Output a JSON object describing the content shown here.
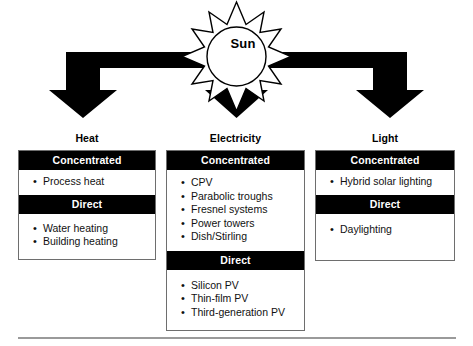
{
  "diagram": {
    "source": {
      "label": "Sun",
      "icon": "sun-icon"
    },
    "columns": [
      {
        "title": "Heat",
        "sections": [
          {
            "header": "Concentrated",
            "items": [
              "Process heat"
            ]
          },
          {
            "header": "Direct",
            "items": [
              "Water heating",
              "Building heating"
            ]
          }
        ]
      },
      {
        "title": "Electricity",
        "sections": [
          {
            "header": "Concentrated",
            "items": [
              "CPV",
              "Parabolic troughs",
              "Fresnel systems",
              "Power towers",
              "Dish/Stirling"
            ]
          },
          {
            "header": "Direct",
            "items": [
              "Silicon PV",
              "Thin-film PV",
              "Third-generation PV"
            ]
          }
        ]
      },
      {
        "title": "Light",
        "sections": [
          {
            "header": "Concentrated",
            "items": [
              "Hybrid solar lighting"
            ]
          },
          {
            "header": "Direct",
            "items": [
              "Daylighting"
            ]
          }
        ]
      }
    ],
    "bullet_glyph": "•",
    "colors": {
      "band_background": "#000000",
      "band_text": "#ffffff",
      "panel_border": "#6e6e6e",
      "arrow": "#000000",
      "page_background": "#ffffff",
      "rule": "#9a9a9a"
    }
  }
}
